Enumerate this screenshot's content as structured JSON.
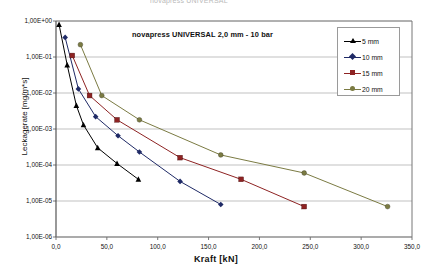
{
  "cropped_top_text": "novapress UNIVERSAL",
  "chart_title": "novapress UNIVERSAL 2,0 mm  -  10 bar",
  "axes": {
    "xlabel": "Kraft  [kN]",
    "ylabel": "Leckagerate  [mg/m*s]",
    "xticks": [
      "0,0",
      "50,0",
      "100,0",
      "150,0",
      "200,0",
      "250,0",
      "300,0",
      "350,0"
    ],
    "yticks": [
      "1,00E+00",
      "1,00E-01",
      "1,00E-02",
      "1,00E-03",
      "1,00E-04",
      "1,00E-05",
      "1,00E-06"
    ]
  },
  "legend": {
    "items": [
      {
        "label": "5 mm",
        "color": "#000000",
        "marker": "triangle"
      },
      {
        "label": "10 mm",
        "color": "#1f2a66",
        "marker": "diamond"
      },
      {
        "label": "15 mm",
        "color": "#8e2323",
        "marker": "square"
      },
      {
        "label": "20 mm",
        "color": "#7b7b43",
        "marker": "circle"
      }
    ]
  },
  "chart_data": {
    "type": "line",
    "title": "novapress UNIVERSAL 2,0 mm  -  10 bar",
    "xlabel": "Kraft  [kN]",
    "ylabel": "Leckagerate  [mg/m*s]",
    "xlim": [
      0,
      350
    ],
    "ylim": [
      1e-06,
      1.0
    ],
    "yscale": "log",
    "grid": true,
    "legend_position": "top-right",
    "series": [
      {
        "name": "5 mm",
        "color": "#000000",
        "marker": "triangle",
        "points": [
          {
            "x": 3,
            "y": 0.8
          },
          {
            "x": 11,
            "y": 0.06
          },
          {
            "x": 20,
            "y": 0.0045
          },
          {
            "x": 27,
            "y": 0.0013
          },
          {
            "x": 41,
            "y": 0.0003
          },
          {
            "x": 60,
            "y": 0.00011
          },
          {
            "x": 81,
            "y": 4e-05
          }
        ]
      },
      {
        "name": "10 mm",
        "color": "#1f2a66",
        "marker": "diamond",
        "points": [
          {
            "x": 9,
            "y": 0.35
          },
          {
            "x": 22,
            "y": 0.013
          },
          {
            "x": 39,
            "y": 0.0022
          },
          {
            "x": 61,
            "y": 0.00065
          },
          {
            "x": 82,
            "y": 0.00023
          },
          {
            "x": 122,
            "y": 3.5e-05
          },
          {
            "x": 162,
            "y": 8e-06
          }
        ]
      },
      {
        "name": "15 mm",
        "color": "#8e2323",
        "marker": "square",
        "points": [
          {
            "x": 16,
            "y": 0.11
          },
          {
            "x": 33,
            "y": 0.0085
          },
          {
            "x": 60,
            "y": 0.0018
          },
          {
            "x": 122,
            "y": 0.00016
          },
          {
            "x": 182,
            "y": 4e-05
          },
          {
            "x": 244,
            "y": 7e-06
          }
        ]
      },
      {
        "name": "20 mm",
        "color": "#7b7b43",
        "marker": "circle",
        "points": [
          {
            "x": 24,
            "y": 0.22
          },
          {
            "x": 45,
            "y": 0.0085
          },
          {
            "x": 82,
            "y": 0.0018
          },
          {
            "x": 162,
            "y": 0.00019
          },
          {
            "x": 244,
            "y": 6e-05
          },
          {
            "x": 326,
            "y": 7e-06
          }
        ]
      }
    ]
  }
}
